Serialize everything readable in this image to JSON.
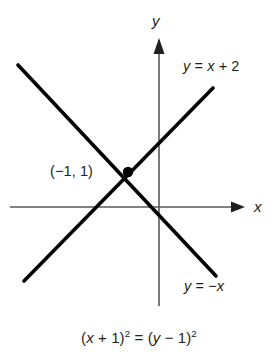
{
  "figure": {
    "title_caption": "(x + 1)2 = (y − 1)2",
    "caption_parts": {
      "lhs_open": "(",
      "lhs_var": "x",
      "lhs_op": " + 1)",
      "lhs_exp": "2",
      "equals": " = ",
      "rhs_open": "(",
      "rhs_var": "y",
      "rhs_op": " − 1)",
      "rhs_exp": "2"
    },
    "axes": {
      "x_label": "x",
      "y_label": "y",
      "color": "#58595b",
      "origin": {
        "x": 159,
        "y": 207
      }
    },
    "lines": [
      {
        "name": "line-y-equals-x-plus-2",
        "label": "y = x + 2",
        "label_parts": {
          "lhs": "y",
          "eq": " = ",
          "rhs_var": "x",
          "rhs_rest": " + 2"
        },
        "slope": 1,
        "intercept": 2,
        "color": "#000000",
        "endpoints": [
          {
            "x": 24,
            "y": 281
          },
          {
            "x": 213,
            "y": 88
          }
        ]
      },
      {
        "name": "line-y-equals-minus-x",
        "label": "y = −x",
        "label_parts": {
          "lhs": "y",
          "eq": " = ",
          "rhs_var": "x",
          "rhs_rest": "−"
        },
        "slope": -1,
        "intercept": 0,
        "color": "#000000",
        "endpoints": [
          {
            "x": 18,
            "y": 65
          },
          {
            "x": 216,
            "y": 276
          }
        ]
      }
    ],
    "points": [
      {
        "name": "intersection-point",
        "label": "(−1, 1)",
        "coords": {
          "x": -1,
          "y": 1
        },
        "pixel": {
          "x": 128,
          "y": 172
        },
        "color": "#000000"
      }
    ]
  }
}
